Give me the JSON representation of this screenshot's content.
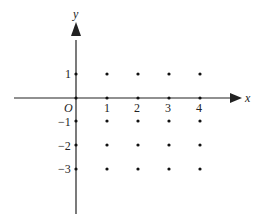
{
  "diagram": {
    "type": "coordinate-grid-points",
    "axes": {
      "x_label": "x",
      "y_label": "y",
      "origin_label": "O",
      "x_ticks": [
        "1",
        "2",
        "3",
        "4"
      ],
      "y_ticks_positive": [
        "1"
      ],
      "y_ticks_negative": [
        "−1",
        "−2",
        "−3"
      ]
    },
    "points": [
      [
        0,
        1
      ],
      [
        1,
        1
      ],
      [
        2,
        1
      ],
      [
        3,
        1
      ],
      [
        4,
        1
      ],
      [
        0,
        0
      ],
      [
        1,
        0
      ],
      [
        2,
        0
      ],
      [
        3,
        0
      ],
      [
        4,
        0
      ],
      [
        0,
        -1
      ],
      [
        1,
        -1
      ],
      [
        2,
        -1
      ],
      [
        3,
        -1
      ],
      [
        4,
        -1
      ],
      [
        0,
        -2
      ],
      [
        1,
        -2
      ],
      [
        2,
        -2
      ],
      [
        3,
        -2
      ],
      [
        4,
        -2
      ],
      [
        0,
        -3
      ],
      [
        1,
        -3
      ],
      [
        2,
        -3
      ],
      [
        3,
        -3
      ],
      [
        4,
        -3
      ]
    ],
    "colors": {
      "axis": "#222222",
      "point": "#111111"
    }
  }
}
